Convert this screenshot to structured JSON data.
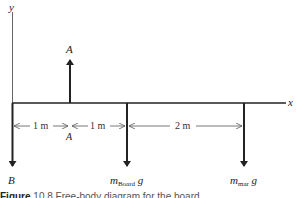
{
  "diagram": {
    "axes": {
      "x_label": "x",
      "y_label": "y"
    },
    "forces": [
      {
        "name": "A",
        "direction": "up",
        "label": "A"
      },
      {
        "name": "B",
        "direction": "down",
        "label": "B"
      },
      {
        "name": "board-weight",
        "direction": "down",
        "label_main": "m",
        "label_sub": "Board",
        "label_tail": " g"
      },
      {
        "name": "mar-weight",
        "direction": "down",
        "label_main": "m",
        "label_sub": "mar",
        "label_tail": " g"
      }
    ],
    "dimensions": [
      {
        "label": "1 m"
      },
      {
        "label": "1 m"
      },
      {
        "label": "2 m"
      }
    ],
    "pivot_label": "A",
    "caption": {
      "prefix": "Figure",
      "text": "10.8  Free-body diagram for the board"
    },
    "colors": {
      "line": "#222222",
      "dim_line": "#555555"
    }
  }
}
